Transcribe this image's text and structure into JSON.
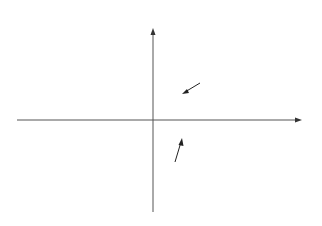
{
  "chart_data": {
    "type": "area",
    "title": "",
    "xlabel": "x",
    "ylabel": "y",
    "grid": false,
    "series": [
      {
        "name": "y = sin x",
        "function": "sin"
      },
      {
        "name": "y = cos x",
        "function": "cos"
      }
    ],
    "shaded_region": "region between y = sin x and y = cos x",
    "x_range": [
      -3.6,
      3.1
    ],
    "x_range_units": "multiples of pi",
    "y_range": [
      -1,
      1
    ],
    "annotations": [
      {
        "text": "y = sin x",
        "points_to": "sin curve"
      },
      {
        "text": "y = cos x",
        "points_to": "cos curve"
      }
    ]
  },
  "labels": {
    "x_axis": "x",
    "y_axis": "y",
    "sin_prefix": "y",
    "sin_eq": " = sin ",
    "sin_var": "x",
    "cos_prefix": "y",
    "cos_eq": " = cos ",
    "cos_var": "x"
  },
  "colors": {
    "curve": "#111111",
    "fill": "#d4d4d4",
    "axis": "#555555"
  }
}
